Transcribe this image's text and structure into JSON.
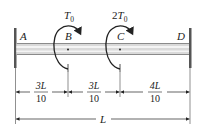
{
  "diagram": {
    "type": "torsion-shaft",
    "points": [
      {
        "id": "A",
        "label": "A",
        "x": 15
      },
      {
        "id": "B",
        "label": "B",
        "x": 68
      },
      {
        "id": "C",
        "label": "C",
        "x": 120
      },
      {
        "id": "D",
        "label": "D",
        "x": 190
      }
    ],
    "torques": [
      {
        "at": "B",
        "label_main": "T",
        "label_sub": "0",
        "prefix": ""
      },
      {
        "at": "C",
        "label_main": "T",
        "label_sub": "0",
        "prefix": "2"
      }
    ],
    "dimensions": [
      {
        "from": "A",
        "to": "B",
        "numerator": "3L",
        "denominator": "10"
      },
      {
        "from": "B",
        "to": "C",
        "numerator": "3L",
        "denominator": "10"
      },
      {
        "from": "C",
        "to": "D",
        "numerator": "4L",
        "denominator": "10"
      }
    ],
    "total_length": {
      "label": "L"
    },
    "colors": {
      "wall": "#555555",
      "shaft_outline": "#8a8a8a",
      "shaft_fill": "#d9d9d9",
      "shaft_highlight": "#f4f4f4",
      "ink": "#222222"
    }
  }
}
